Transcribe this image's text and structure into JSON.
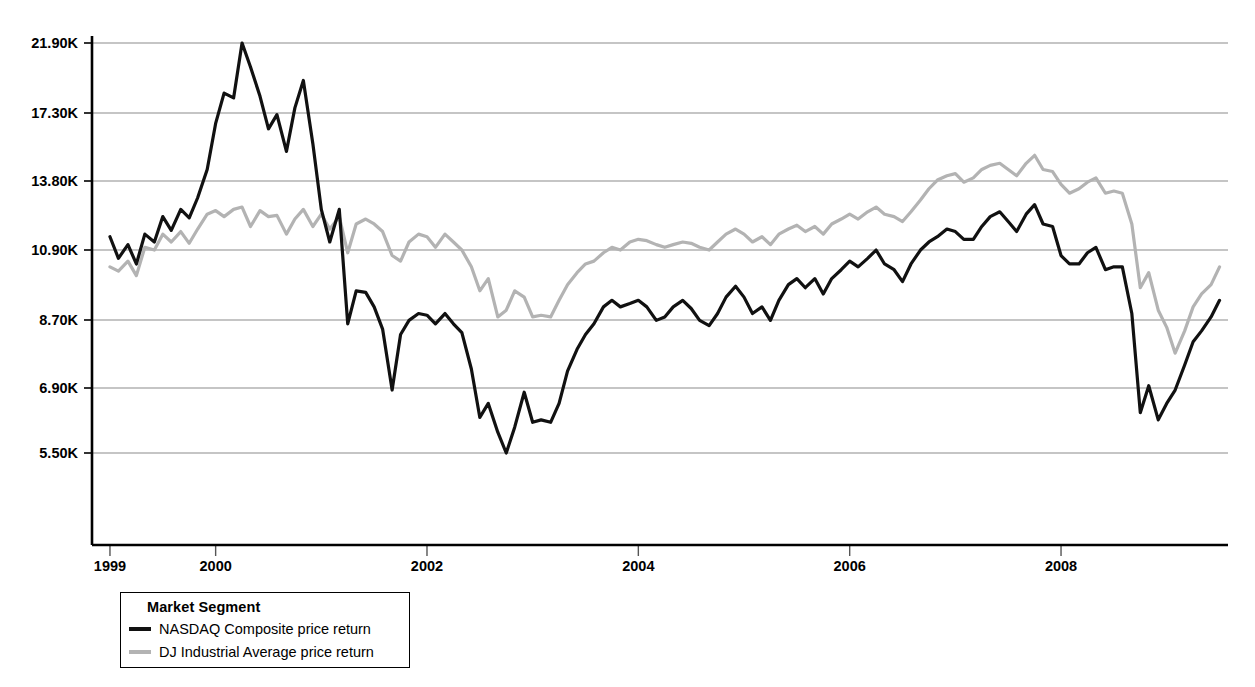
{
  "chart_data": {
    "type": "line",
    "title": "",
    "subtitle": "",
    "xlabel": "",
    "ylabel": "",
    "yscale": "log",
    "ylim": [
      4600,
      24000
    ],
    "xlim": [
      1998.83,
      2009.58
    ],
    "grid": true,
    "y_ticks": [
      5500,
      6900,
      8700,
      10900,
      13800,
      17300,
      21900
    ],
    "y_tick_labels": [
      "5.50K",
      "6.90K",
      "8.70K",
      "10.90K",
      "13.80K",
      "17.30K",
      "21.90K"
    ],
    "x_ticks": [
      1999,
      2000,
      2002,
      2004,
      2006,
      2008
    ],
    "x_tick_labels": [
      "1999",
      "2000",
      "2002",
      "2004",
      "2006",
      "2008"
    ],
    "legend": {
      "title": "Market Segment",
      "position": "below-left",
      "entries": [
        {
          "label": "NASDAQ Composite price return",
          "color": "#111111"
        },
        {
          "label": "DJ Industrial Average price return",
          "color": "#b3b3b3"
        }
      ]
    },
    "series": [
      {
        "name": "NASDAQ Composite price return",
        "color": "#111111",
        "width": 3.2,
        "x": [
          1999.0,
          1999.08,
          1999.17,
          1999.25,
          1999.33,
          1999.42,
          1999.5,
          1999.58,
          1999.67,
          1999.75,
          1999.83,
          1999.92,
          2000.0,
          2000.08,
          2000.17,
          2000.25,
          2000.33,
          2000.42,
          2000.5,
          2000.58,
          2000.67,
          2000.75,
          2000.83,
          2000.92,
          2001.0,
          2001.08,
          2001.17,
          2001.25,
          2001.33,
          2001.42,
          2001.5,
          2001.58,
          2001.67,
          2001.75,
          2001.83,
          2001.92,
          2002.0,
          2002.08,
          2002.17,
          2002.25,
          2002.33,
          2002.42,
          2002.5,
          2002.58,
          2002.67,
          2002.75,
          2002.83,
          2002.92,
          2003.0,
          2003.08,
          2003.17,
          2003.25,
          2003.33,
          2003.42,
          2003.5,
          2003.58,
          2003.67,
          2003.75,
          2003.83,
          2003.92,
          2004.0,
          2004.08,
          2004.17,
          2004.25,
          2004.33,
          2004.42,
          2004.5,
          2004.58,
          2004.67,
          2004.75,
          2004.83,
          2004.92,
          2005.0,
          2005.08,
          2005.17,
          2005.25,
          2005.33,
          2005.42,
          2005.5,
          2005.58,
          2005.67,
          2005.75,
          2005.83,
          2005.92,
          2006.0,
          2006.08,
          2006.17,
          2006.25,
          2006.33,
          2006.42,
          2006.5,
          2006.58,
          2006.67,
          2006.75,
          2006.83,
          2006.92,
          2007.0,
          2007.08,
          2007.17,
          2007.25,
          2007.33,
          2007.42,
          2007.5,
          2007.58,
          2007.67,
          2007.75,
          2007.83,
          2007.92,
          2008.0,
          2008.08,
          2008.17,
          2008.25,
          2008.33,
          2008.42,
          2008.5,
          2008.58,
          2008.67,
          2008.75,
          2008.83,
          2008.92,
          2009.0,
          2009.08,
          2009.17,
          2009.25,
          2009.33,
          2009.42,
          2009.5
        ],
        "y": [
          11400,
          10600,
          11100,
          10400,
          11500,
          11200,
          12200,
          11650,
          12500,
          12150,
          13000,
          14300,
          16700,
          18500,
          18200,
          21900,
          20200,
          18300,
          16400,
          17200,
          15200,
          17600,
          19300,
          15600,
          12500,
          11200,
          12500,
          8500,
          9500,
          9450,
          9000,
          8350,
          6800,
          8200,
          8600,
          8800,
          8750,
          8500,
          8800,
          8500,
          8250,
          7300,
          6200,
          6500,
          5900,
          5500,
          6000,
          6750,
          6100,
          6150,
          6100,
          6500,
          7250,
          7800,
          8200,
          8500,
          9000,
          9200,
          9000,
          9100,
          9200,
          9000,
          8600,
          8700,
          9000,
          9200,
          8950,
          8600,
          8450,
          8800,
          9300,
          9650,
          9300,
          8800,
          9000,
          8600,
          9200,
          9700,
          9900,
          9600,
          9900,
          9400,
          9900,
          10200,
          10500,
          10300,
          10600,
          10900,
          10400,
          10200,
          9800,
          10400,
          10900,
          11200,
          11400,
          11700,
          11600,
          11300,
          11300,
          11800,
          12200,
          12400,
          12000,
          11600,
          12300,
          12700,
          11900,
          11800,
          10700,
          10400,
          10400,
          10800,
          11000,
          10200,
          10300,
          10300,
          8800,
          6300,
          6900,
          6150,
          6500,
          6800,
          7400,
          8000,
          8300,
          8700,
          9200
        ]
      },
      {
        "name": "DJ Industrial Average price return",
        "color": "#b3b3b3",
        "width": 3.2,
        "x": [
          1999.0,
          1999.08,
          1999.17,
          1999.25,
          1999.33,
          1999.42,
          1999.5,
          1999.58,
          1999.67,
          1999.75,
          1999.83,
          1999.92,
          2000.0,
          2000.08,
          2000.17,
          2000.25,
          2000.33,
          2000.42,
          2000.5,
          2000.58,
          2000.67,
          2000.75,
          2000.83,
          2000.92,
          2001.0,
          2001.08,
          2001.17,
          2001.25,
          2001.33,
          2001.42,
          2001.5,
          2001.58,
          2001.67,
          2001.75,
          2001.83,
          2001.92,
          2002.0,
          2002.08,
          2002.17,
          2002.25,
          2002.33,
          2002.42,
          2002.5,
          2002.58,
          2002.67,
          2002.75,
          2002.83,
          2002.92,
          2003.0,
          2003.08,
          2003.17,
          2003.25,
          2003.33,
          2003.42,
          2003.5,
          2003.58,
          2003.67,
          2003.75,
          2003.83,
          2003.92,
          2004.0,
          2004.08,
          2004.17,
          2004.25,
          2004.33,
          2004.42,
          2004.5,
          2004.58,
          2004.67,
          2004.75,
          2004.83,
          2004.92,
          2005.0,
          2005.08,
          2005.17,
          2005.25,
          2005.33,
          2005.42,
          2005.5,
          2005.58,
          2005.67,
          2005.75,
          2005.83,
          2005.92,
          2006.0,
          2006.08,
          2006.17,
          2006.25,
          2006.33,
          2006.42,
          2006.5,
          2006.58,
          2006.67,
          2006.75,
          2006.83,
          2006.92,
          2007.0,
          2007.08,
          2007.17,
          2007.25,
          2007.33,
          2007.42,
          2007.5,
          2007.58,
          2007.67,
          2007.75,
          2007.83,
          2007.92,
          2008.0,
          2008.08,
          2008.17,
          2008.25,
          2008.33,
          2008.42,
          2008.5,
          2008.58,
          2008.67,
          2008.75,
          2008.83,
          2008.92,
          2009.0,
          2009.08,
          2009.17,
          2009.25,
          2009.33,
          2009.42,
          2009.5
        ],
        "y": [
          10300,
          10150,
          10500,
          10000,
          11000,
          10900,
          11500,
          11200,
          11600,
          11150,
          11700,
          12300,
          12450,
          12200,
          12500,
          12600,
          11800,
          12450,
          12200,
          12250,
          11500,
          12100,
          12500,
          11800,
          12300,
          11700,
          12200,
          10800,
          11900,
          12100,
          11900,
          11600,
          10700,
          10500,
          11200,
          11500,
          11400,
          11000,
          11500,
          11200,
          10900,
          10300,
          9500,
          9900,
          8700,
          8900,
          9500,
          9300,
          8700,
          8750,
          8700,
          9200,
          9700,
          10100,
          10400,
          10500,
          10800,
          11000,
          10900,
          11200,
          11300,
          11250,
          11100,
          11000,
          11100,
          11200,
          11150,
          11000,
          10900,
          11200,
          11500,
          11700,
          11500,
          11200,
          11400,
          11100,
          11500,
          11700,
          11850,
          11600,
          11800,
          11500,
          11900,
          12100,
          12300,
          12100,
          12400,
          12600,
          12300,
          12200,
          12000,
          12400,
          12900,
          13400,
          13800,
          14000,
          14100,
          13700,
          13900,
          14300,
          14500,
          14600,
          14300,
          14000,
          14600,
          15000,
          14300,
          14200,
          13600,
          13200,
          13400,
          13700,
          13900,
          13200,
          13300,
          13200,
          11900,
          9600,
          10100,
          8900,
          8400,
          7700,
          8300,
          9000,
          9400,
          9700,
          10300
        ]
      }
    ],
    "annotations": []
  },
  "legend": {
    "title": "Market Segment",
    "entries": [
      {
        "label": "NASDAQ Composite price return"
      },
      {
        "label": "DJ Industrial Average price return"
      }
    ]
  },
  "style": {
    "background": "#ffffff",
    "axis_color": "#000000",
    "grid_color": "#8c8c8c",
    "nasdaq_color": "#111111",
    "dj_color": "#b3b3b3"
  }
}
